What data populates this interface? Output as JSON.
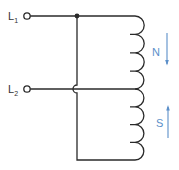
{
  "diagram": {
    "type": "circuit-schematic",
    "terminals": [
      {
        "label": "L",
        "subscript": "1"
      },
      {
        "label": "L",
        "subscript": "2"
      }
    ],
    "coil_sections": [
      {
        "pole": "N",
        "arrow_direction": "down"
      },
      {
        "pole": "S",
        "arrow_direction": "up"
      }
    ],
    "colors": {
      "wire": "#2a2a2a",
      "arrow": "#5b8fc9",
      "label": "#333333"
    }
  }
}
